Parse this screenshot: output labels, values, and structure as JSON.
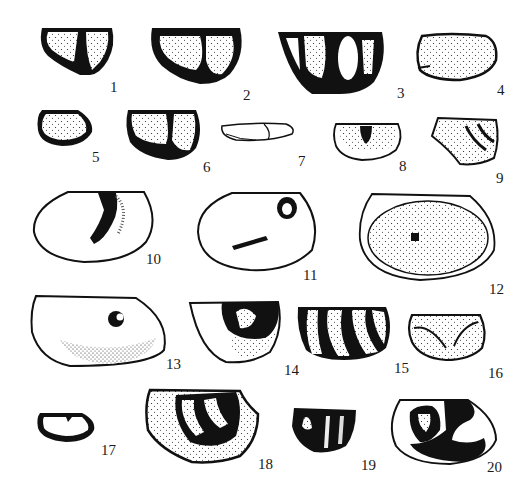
{
  "plate": {
    "figures": [
      {
        "number": "1",
        "label_x": 110,
        "label_y": 80,
        "shape": "solid"
      },
      {
        "number": "2",
        "label_x": 243,
        "label_y": 88,
        "shape": "solid"
      },
      {
        "number": "3",
        "label_x": 397,
        "label_y": 86,
        "shape": "solid"
      },
      {
        "number": "4",
        "label_x": 497,
        "label_y": 83,
        "shape": "stippled"
      },
      {
        "number": "5",
        "label_x": 92,
        "label_y": 150,
        "shape": "solid"
      },
      {
        "number": "6",
        "label_x": 203,
        "label_y": 160,
        "shape": "solid"
      },
      {
        "number": "7",
        "label_x": 298,
        "label_y": 154,
        "shape": "outline"
      },
      {
        "number": "8",
        "label_x": 399,
        "label_y": 159,
        "shape": "stippled"
      },
      {
        "number": "9",
        "label_x": 496,
        "label_y": 171,
        "shape": "stippled"
      },
      {
        "number": "10",
        "label_x": 146,
        "label_y": 252,
        "shape": "outline"
      },
      {
        "number": "11",
        "label_x": 303,
        "label_y": 268,
        "shape": "outline"
      },
      {
        "number": "12",
        "label_x": 489,
        "label_y": 282,
        "shape": "stippled"
      },
      {
        "number": "13",
        "label_x": 166,
        "label_y": 357,
        "shape": "outline"
      },
      {
        "number": "14",
        "label_x": 284,
        "label_y": 363,
        "shape": "solid"
      },
      {
        "number": "15",
        "label_x": 394,
        "label_y": 361,
        "shape": "solid"
      },
      {
        "number": "16",
        "label_x": 488,
        "label_y": 366,
        "shape": "stippled"
      },
      {
        "number": "17",
        "label_x": 101,
        "label_y": 443,
        "shape": "solid"
      },
      {
        "number": "18",
        "label_x": 258,
        "label_y": 457,
        "shape": "solid"
      },
      {
        "number": "19",
        "label_x": 361,
        "label_y": 458,
        "shape": "solid"
      },
      {
        "number": "20",
        "label_x": 487,
        "label_y": 460,
        "shape": "outline"
      }
    ]
  }
}
